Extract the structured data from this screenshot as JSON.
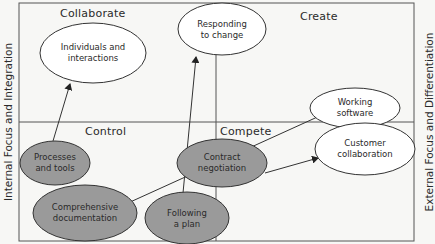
{
  "quadrants": {
    "top_left": "Collaborate",
    "top_right": "Create",
    "bottom_left": "Control",
    "bottom_right": "Compete"
  },
  "axes": {
    "left": "Internal Focus and Integration",
    "right": "External Focus and Differentiation"
  },
  "nodes": [
    {
      "id": "individuals",
      "line1": "Individuals and",
      "line2": "interactions",
      "style": "white"
    },
    {
      "id": "responding",
      "line1": "Responding",
      "line2": "to change",
      "style": "white"
    },
    {
      "id": "working",
      "line1": "Working",
      "line2": "software",
      "style": "white"
    },
    {
      "id": "customer",
      "line1": "Customer",
      "line2": "collaboration",
      "style": "white"
    },
    {
      "id": "processes",
      "line1": "Processes",
      "line2": "and tools",
      "style": "grey"
    },
    {
      "id": "documentation",
      "line1": "Comprehensive",
      "line2": "documentation",
      "style": "grey"
    },
    {
      "id": "contract",
      "line1": "Contract",
      "line2": "negotiation",
      "style": "grey"
    },
    {
      "id": "plan",
      "line1": "Following",
      "line2": "a plan",
      "style": "grey"
    }
  ],
  "edges": [
    {
      "from": "Processes and tools",
      "to": "Individuals and interactions"
    },
    {
      "from": "Following a plan",
      "to": "Responding to change"
    },
    {
      "from": "Comprehensive documentation",
      "to": "Working software"
    },
    {
      "from": "Contract negotiation",
      "to": "Customer collaboration"
    }
  ],
  "colors": {
    "white_fill": "#ffffff",
    "grey_fill": "#9a9a9a",
    "stroke": "#3a3a3a",
    "background": "#f7f7f5"
  }
}
